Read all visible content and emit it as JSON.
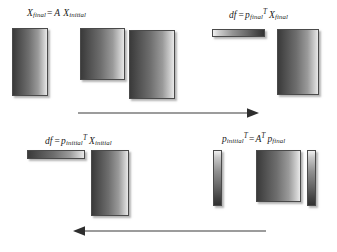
{
  "diagram": {
    "background_color": "#ffffff",
    "stroke_color": "#4a4a4a",
    "formulas": {
      "top_left": {
        "name": "x-final-equals-a-x-initial",
        "var1": "X",
        "sub1": "final",
        "equals": "=",
        "var2": "A",
        "var3": "X",
        "sub3": "initial",
        "plain": "X_final = A X_initial"
      },
      "top_right": {
        "name": "df-equals-p-final-transpose-x-final",
        "var1": "df",
        "equals": "=",
        "var2": "p",
        "sub2": "final",
        "sup2": "T",
        "var3": "X",
        "sub3": "final",
        "plain": "df = p_final^T X_final"
      },
      "bottom_left": {
        "name": "df-equals-p-initial-transpose-x-initial",
        "var1": "df",
        "equals": "=",
        "var2": "p",
        "sub2": "initial",
        "sup2": "T",
        "var3": "X",
        "sub3": "initial",
        "plain": "df = p_initial^T X_initial"
      },
      "bottom_right": {
        "name": "p-initial-transpose-equals-a-transpose-p-final",
        "var1": "p",
        "sub1": "initial",
        "sup1": "T",
        "equals": "=",
        "var2": "A",
        "sup2": "T",
        "var3": "p",
        "sub3": "final",
        "plain": "p_initial^T = A^T p_final"
      }
    },
    "blocks": [
      {
        "name": "x-final-matrix-block",
        "gradient": "dark-to-light-horizontal"
      },
      {
        "name": "a-matrix-block",
        "gradient": "dark-to-light-horizontal"
      },
      {
        "name": "x-initial-matrix-block",
        "gradient": "dark-to-light-horizontal"
      },
      {
        "name": "p-final-transpose-row-block",
        "gradient": "light-to-dark-horizontal"
      },
      {
        "name": "x-final-column-block",
        "gradient": "dark-to-light-horizontal"
      },
      {
        "name": "p-initial-transpose-row-block",
        "gradient": "dark-to-light-horizontal"
      },
      {
        "name": "x-initial-column-block",
        "gradient": "dark-to-light-horizontal"
      },
      {
        "name": "p-initial-transpose-col-block",
        "gradient": "light-to-dark-vertical"
      },
      {
        "name": "a-transpose-matrix-block",
        "gradient": "dark-to-light-horizontal"
      },
      {
        "name": "p-final-column-block",
        "gradient": "light-to-dark-vertical"
      }
    ],
    "arrows": [
      {
        "name": "forward-flow-arrow",
        "direction": "right"
      },
      {
        "name": "adjoint-flow-arrow",
        "direction": "left"
      }
    ]
  }
}
